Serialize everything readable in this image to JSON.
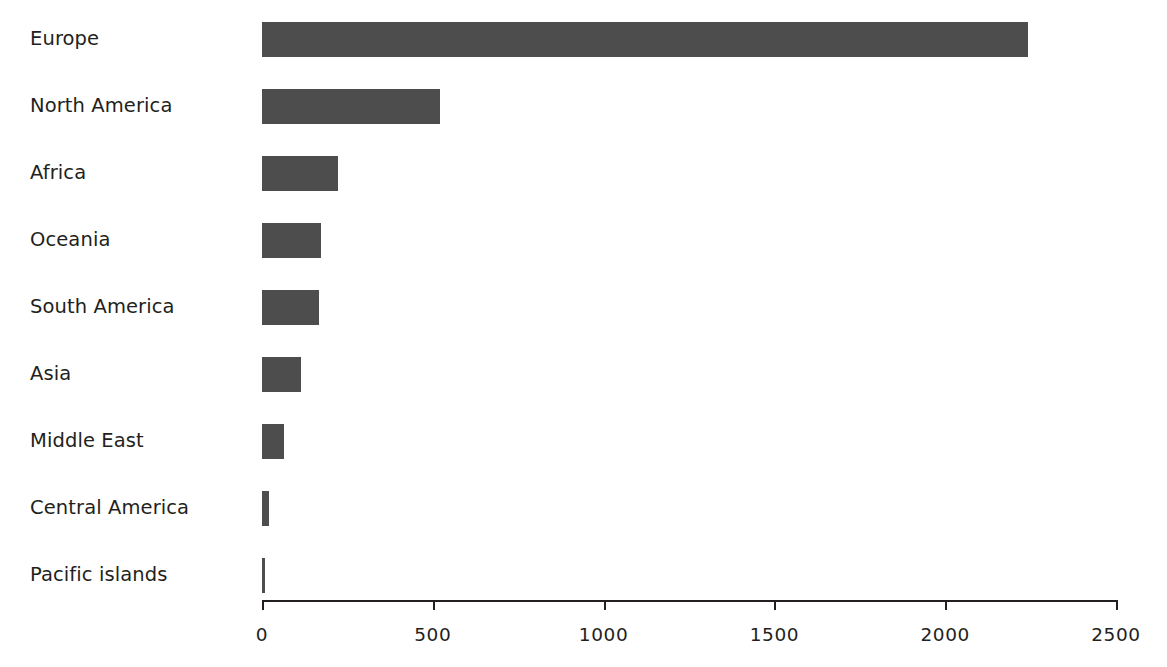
{
  "chart_data": {
    "type": "bar",
    "orientation": "horizontal",
    "title": "",
    "subtitle": "",
    "xlabel": "",
    "ylabel": "",
    "categories": [
      "Europe",
      "North America",
      "Africa",
      "Oceania",
      "South America",
      "Asia",
      "Middle East",
      "Central America",
      "Pacific islands"
    ],
    "values": [
      2243,
      521,
      222,
      173,
      167,
      114,
      64,
      20,
      8
    ],
    "series": [
      {
        "name": "",
        "values": [
          2243,
          521,
          222,
          173,
          167,
          114,
          64,
          20,
          8
        ]
      }
    ],
    "xlim": [
      0,
      2500
    ],
    "xticks": [
      0,
      500,
      1000,
      1500,
      2000,
      2500
    ],
    "xtick_labels": [
      "0",
      "500",
      "1000",
      "1500",
      "2000",
      "2500"
    ],
    "grid": false,
    "legend": false,
    "legend_position": "none",
    "annotations": [],
    "bar_color": "#4d4d4d",
    "axis_color": "#231f20",
    "background_color": "#ffffff",
    "label_color": "#231f20"
  },
  "axis": {
    "x_tick_labels": [
      "0",
      "500",
      "1000",
      "1500",
      "2000",
      "2500"
    ]
  },
  "categories": {
    "items": [
      {
        "label": "Europe",
        "value": 2243
      },
      {
        "label": "North America",
        "value": 521
      },
      {
        "label": "Africa",
        "value": 222
      },
      {
        "label": "Oceania",
        "value": 173
      },
      {
        "label": "South America",
        "value": 167
      },
      {
        "label": "Asia",
        "value": 114
      },
      {
        "label": "Middle East",
        "value": 64
      },
      {
        "label": "Central America",
        "value": 20
      },
      {
        "label": "Pacific islands",
        "value": 8
      }
    ]
  }
}
